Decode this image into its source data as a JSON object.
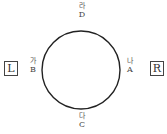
{
  "diagram": {
    "shape": "circle",
    "points": {
      "top": {
        "korean": "라",
        "letter": "D"
      },
      "bottom": {
        "korean": "다",
        "letter": "C"
      },
      "left": {
        "korean": "가",
        "letter": "B"
      },
      "right": {
        "korean": "나",
        "letter": "A"
      }
    },
    "side_labels": {
      "left": "L",
      "right": "R"
    },
    "colors": {
      "stroke": "#222222",
      "text": "#444444"
    }
  }
}
